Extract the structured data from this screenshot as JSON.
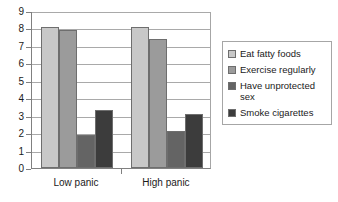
{
  "chart_data": {
    "type": "bar",
    "title": "",
    "subtitle": "",
    "xlabel": "",
    "ylabel": "",
    "categories": [
      "Low panic",
      "High panic"
    ],
    "series": [
      {
        "name": "Eat fatty foods",
        "values": [
          8.1,
          8.1
        ],
        "color": "#c8c8c8"
      },
      {
        "name": "Exercise regularly",
        "values": [
          7.9,
          7.4
        ],
        "color": "#9b9b9b"
      },
      {
        "name": "Have unprotected sex",
        "values": [
          1.9,
          2.1
        ],
        "color": "#646464"
      },
      {
        "name": "Smoke cigarettes",
        "values": [
          3.3,
          3.1
        ],
        "color": "#3c3c3c"
      }
    ],
    "ylim": [
      0,
      9
    ],
    "ytick_labels": [
      "0",
      "1",
      "2",
      "3",
      "4",
      "5",
      "6",
      "7",
      "8",
      "9"
    ],
    "ytick_values": [
      0,
      1,
      2,
      3,
      4,
      5,
      6,
      7,
      8,
      9
    ],
    "grid": true,
    "grid_axis": "y",
    "legend_position": "right",
    "bar_border_color": "#6e6e6e",
    "axis_color": "#808080",
    "gridline_color": "#a9a9a9",
    "text_color": "#1a1a1a",
    "background": "#ffffff"
  },
  "legend": {
    "entries": [
      {
        "label": "Eat fatty foods"
      },
      {
        "label": "Exercise regularly"
      },
      {
        "label": "Have unprotected sex"
      },
      {
        "label": "Smoke cigarettes"
      }
    ]
  }
}
